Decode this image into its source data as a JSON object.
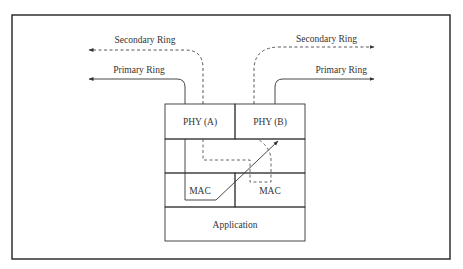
{
  "diagram": {
    "rings": {
      "left_secondary": "Secondary Ring",
      "left_primary": "Primary Ring",
      "right_secondary": "Secondary Ring",
      "right_primary": "Primary Ring"
    },
    "stack": {
      "phy_a": "PHY (A)",
      "phy_b": "PHY (B)",
      "mac_left": "MAC",
      "mac_right": "MAC",
      "application": "Application"
    },
    "colors": {
      "line": "#333333",
      "frame": "#222222",
      "background": "#ffffff"
    }
  }
}
